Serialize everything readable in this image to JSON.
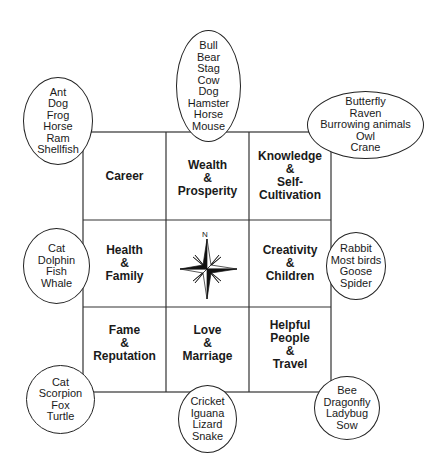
{
  "grid": {
    "cells": [
      {
        "id": "career",
        "label": "Career"
      },
      {
        "id": "wealth",
        "label": "Wealth\n&\nProsperity"
      },
      {
        "id": "knowledge",
        "label": "Knowledge\n&\nSelf-\nCultivation"
      },
      {
        "id": "health",
        "label": "Health\n&\nFamily"
      },
      {
        "id": "center",
        "label": ""
      },
      {
        "id": "creativity",
        "label": "Creativity\n&\nChildren"
      },
      {
        "id": "fame",
        "label": "Fame\n&\nReputation"
      },
      {
        "id": "love",
        "label": "Love\n&\nMarriage"
      },
      {
        "id": "helpful",
        "label": "Helpful\nPeople\n&\nTravel"
      }
    ]
  },
  "compass": {
    "north_label": "N"
  },
  "animals": {
    "top_left": [
      "Ant",
      "Dog",
      "Frog",
      "Horse",
      "Ram",
      "Shellfish"
    ],
    "top": [
      "Bull",
      "Bear",
      "Stag",
      "Cow",
      "Dog",
      "Hamster",
      "Horse",
      "Mouse"
    ],
    "top_right": [
      "Butterfly",
      "Raven",
      "Burrowing animals",
      "Owl",
      "Crane"
    ],
    "left": [
      "Cat",
      "Dolphin",
      "Fish",
      "Whale"
    ],
    "right": [
      "Rabbit",
      "Most birds",
      "Goose",
      "Spider"
    ],
    "bottom_left": [
      "Cat",
      "Scorpion",
      "Fox",
      "Turtle"
    ],
    "bottom": [
      "Cricket",
      "Iguana",
      "Lizard",
      "Snake"
    ],
    "bottom_right": [
      "Bee",
      "Dragonfly",
      "Ladybug",
      "Sow"
    ]
  }
}
